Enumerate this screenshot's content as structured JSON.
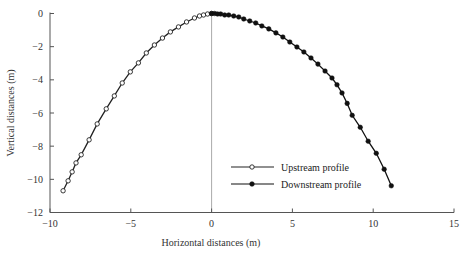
{
  "chart_data": {
    "type": "line",
    "title": "",
    "xlabel": "Horizontal distances (m)",
    "ylabel": "Vertical distances (m)",
    "xlim": [
      -10,
      15
    ],
    "ylim": [
      -12,
      0
    ],
    "xticks": [
      -10,
      -5,
      0,
      5,
      10,
      15
    ],
    "yticks": [
      0,
      -2,
      -4,
      -6,
      -8,
      -10,
      -12
    ],
    "xtick_labels": [
      "−10",
      "−5",
      "0",
      "5",
      "10",
      "15"
    ],
    "ytick_labels": [
      "0",
      "−2",
      "−4",
      "−6",
      "−8",
      "−10",
      "−12"
    ],
    "grid": false,
    "reference_line": {
      "x": 0,
      "color": "#aaaaaa"
    },
    "legend": {
      "position": "lower-center",
      "entries": [
        "Upstream profile",
        "Downstream profile"
      ]
    },
    "series": [
      {
        "name": "Upstream profile",
        "marker": "open-circle",
        "color": "#222222",
        "x": [
          -9.19,
          -8.88,
          -8.63,
          -8.39,
          -8.07,
          -7.58,
          -7.08,
          -6.52,
          -6.02,
          -5.53,
          -5.03,
          -4.53,
          -4.04,
          -3.54,
          -3.04,
          -2.55,
          -2.05,
          -1.55,
          -1.06,
          -0.75,
          -0.5,
          -0.25,
          0.0
        ],
        "y": [
          -10.69,
          -10.09,
          -9.55,
          -9.01,
          -8.52,
          -7.62,
          -6.66,
          -5.75,
          -4.97,
          -4.19,
          -3.52,
          -2.98,
          -2.38,
          -1.9,
          -1.48,
          -1.11,
          -0.81,
          -0.51,
          -0.27,
          -0.15,
          -0.09,
          -0.03,
          0.0
        ]
      },
      {
        "name": "Downstream profile",
        "marker": "filled-circle",
        "color": "#111111",
        "x": [
          0.0,
          0.19,
          0.37,
          0.56,
          0.81,
          1.06,
          1.37,
          1.68,
          1.99,
          2.36,
          2.73,
          3.11,
          3.54,
          3.98,
          4.41,
          4.84,
          5.28,
          5.71,
          6.15,
          6.58,
          7.02,
          7.45,
          7.76,
          8.07,
          8.39,
          8.7,
          9.2,
          9.69,
          10.19,
          10.68,
          11.12
        ],
        "y": [
          0.0,
          0.0,
          -0.03,
          -0.03,
          -0.09,
          -0.09,
          -0.15,
          -0.21,
          -0.33,
          -0.45,
          -0.57,
          -0.75,
          -0.93,
          -1.17,
          -1.42,
          -1.72,
          -2.02,
          -2.32,
          -2.68,
          -3.05,
          -3.47,
          -3.89,
          -4.3,
          -4.79,
          -5.42,
          -6.14,
          -6.86,
          -7.7,
          -8.43,
          -9.39,
          -10.39
        ]
      }
    ]
  }
}
